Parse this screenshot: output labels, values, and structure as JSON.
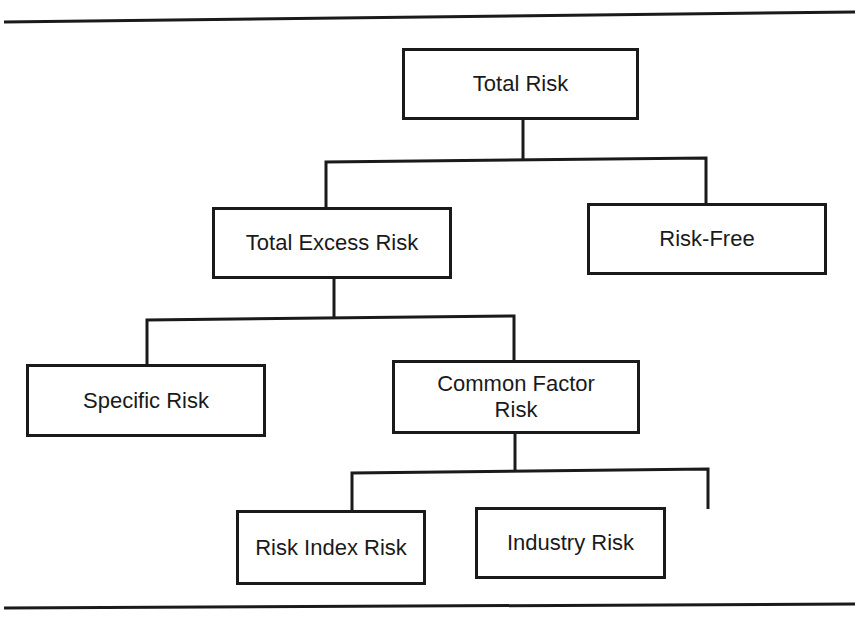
{
  "diagram": {
    "type": "hierarchy",
    "nodes": {
      "total_risk": "Total Risk",
      "total_excess_risk": "Total Excess Risk",
      "risk_free": "Risk-Free",
      "specific_risk": "Specific Risk",
      "common_factor_risk": "Common Factor Risk",
      "risk_index_risk": "Risk Index Risk",
      "industry_risk": "Industry Risk"
    },
    "edges": [
      [
        "Total Risk",
        "Total Excess Risk"
      ],
      [
        "Total Risk",
        "Risk-Free"
      ],
      [
        "Total Excess Risk",
        "Specific Risk"
      ],
      [
        "Total Excess Risk",
        "Common Factor Risk"
      ],
      [
        "Common Factor Risk",
        "Risk Index Risk"
      ],
      [
        "Common Factor Risk",
        "Industry Risk"
      ]
    ]
  }
}
